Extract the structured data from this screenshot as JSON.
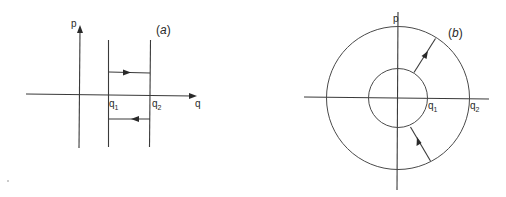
{
  "figure": {
    "panel_a": {
      "label": "(a)",
      "label_letter": "a",
      "axes": {
        "vertical": "p",
        "horizontal": "q"
      },
      "markers": [
        {
          "base": "q",
          "sub": "1"
        },
        {
          "base": "q",
          "sub": "2"
        }
      ],
      "trajectory": {
        "upper_segment_direction": "right",
        "lower_segment_direction": "left"
      }
    },
    "panel_b": {
      "label": "(b)",
      "label_letter": "b",
      "axes": {
        "vertical": "p",
        "horizontal": ""
      },
      "markers": [
        {
          "base": "q",
          "sub": "1"
        },
        {
          "base": "q",
          "sub": "2"
        }
      ],
      "circles": [
        "inner radius q1",
        "outer radius q2"
      ],
      "trajectory": {
        "upper_arrow": "outward (inner to outer circle)",
        "lower_arrow": "inward (outer to inner circle)"
      }
    },
    "colors": {
      "ink": "#2a2a2a",
      "background": "#ffffff"
    }
  }
}
